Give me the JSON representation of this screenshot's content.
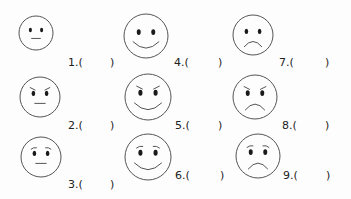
{
  "worksheet": {
    "faces": [
      {
        "number": "1",
        "label": "1.(",
        "close": ")",
        "expression": "neutral",
        "brows": "none",
        "mouth": "flat",
        "cx": 36,
        "cy": 33,
        "r": 17,
        "lx": 68,
        "ly": 57,
        "px": 110
      },
      {
        "number": "2",
        "label": "2.(",
        "close": ")",
        "expression": "angry-neutral",
        "brows": "angry",
        "mouth": "flat",
        "cx": 40,
        "cy": 97,
        "r": 20,
        "lx": 68,
        "ly": 120,
        "px": 110
      },
      {
        "number": "3",
        "label": "3.(",
        "close": ")",
        "expression": "worried-neutral",
        "brows": "worried",
        "mouth": "flat",
        "cx": 41,
        "cy": 157,
        "r": 20,
        "lx": 68,
        "ly": 179,
        "px": 110
      },
      {
        "number": "4",
        "label": "4.(",
        "close": ")",
        "expression": "happy",
        "brows": "none",
        "mouth": "smile",
        "cx": 146,
        "cy": 36,
        "r": 22,
        "lx": 174,
        "ly": 57,
        "px": 218
      },
      {
        "number": "5",
        "label": "5.(",
        "close": ")",
        "expression": "angry-smile",
        "brows": "angry",
        "mouth": "smile",
        "cx": 148,
        "cy": 97,
        "r": 23,
        "lx": 175,
        "ly": 120,
        "px": 218
      },
      {
        "number": "6",
        "label": "6.(",
        "close": ")",
        "expression": "worried-smile",
        "brows": "worried",
        "mouth": "smile",
        "cx": 148,
        "cy": 157,
        "r": 23,
        "lx": 175,
        "ly": 170,
        "px": 220
      },
      {
        "number": "7",
        "label": "7.(",
        "close": ")",
        "expression": "sad",
        "brows": "none",
        "mouth": "frown",
        "cx": 253,
        "cy": 35,
        "r": 20,
        "lx": 279,
        "ly": 57,
        "px": 325
      },
      {
        "number": "8",
        "label": "8.(",
        "close": ")",
        "expression": "angry-sad",
        "brows": "angry",
        "mouth": "frown",
        "cx": 255,
        "cy": 97,
        "r": 22,
        "lx": 282,
        "ly": 120,
        "px": 325
      },
      {
        "number": "9",
        "label": "9.(",
        "close": ")",
        "expression": "worried-sad",
        "brows": "worried",
        "mouth": "frown",
        "cx": 258,
        "cy": 156,
        "r": 22,
        "lx": 283,
        "ly": 170,
        "px": 326
      }
    ],
    "colors": {
      "stroke": "#555555",
      "eyes": "#1a1a1a",
      "text": "#222222"
    }
  }
}
